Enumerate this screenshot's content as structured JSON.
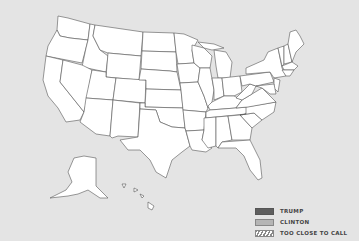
{
  "map": {
    "title": "US Election Map",
    "background_color": "#e4e4e4",
    "state_fill": "#ffffff",
    "state_stroke": "#555555"
  },
  "legend": {
    "items": [
      {
        "label": "TRUMP",
        "color": "#5e5e5e",
        "pattern": "solid"
      },
      {
        "label": "CLINTON",
        "color": "#b5b5b5",
        "pattern": "solid"
      },
      {
        "label": "TOO CLOSE TO CALL",
        "color": "#8a8a8a",
        "pattern": "hatched"
      }
    ]
  }
}
